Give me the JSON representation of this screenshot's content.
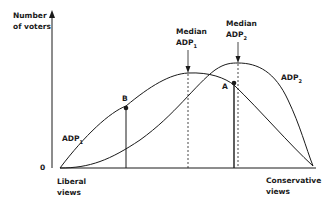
{
  "axes": {
    "y_label_line1": "Number",
    "y_label_line2": "of voters",
    "origin_label": "0",
    "x_left_line1": "Liberal",
    "x_left_line2": "views",
    "x_right_line1": "Conservative",
    "x_right_line2": "views"
  },
  "curves": {
    "adp1_label": "ADP",
    "adp1_sub": "1",
    "adp2_label": "ADP",
    "adp2_sub": "2"
  },
  "medians": {
    "m1_line1": "Median",
    "m1_line2": "ADP",
    "m1_sub": "1",
    "m2_line1": "Median",
    "m2_line2": "ADP",
    "m2_sub": "2"
  },
  "points": {
    "a_label": "A",
    "b_label": "B"
  },
  "colors": {
    "ink": "#1a1a1a",
    "background": "#ffffff"
  }
}
